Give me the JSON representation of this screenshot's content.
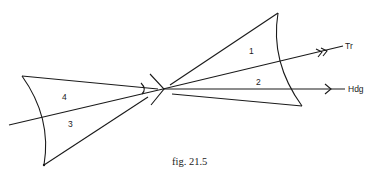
{
  "figure": {
    "caption": "fig. 21.5",
    "regions": [
      {
        "id": "1",
        "label": "1"
      },
      {
        "id": "2",
        "label": "2"
      },
      {
        "id": "3",
        "label": "3"
      },
      {
        "id": "4",
        "label": "4"
      }
    ],
    "lines": {
      "track": {
        "label": "Tr"
      },
      "heading": {
        "label": "Hdg"
      }
    },
    "colors": {
      "ink": "#1a1a1a",
      "background": "#ffffff"
    }
  }
}
